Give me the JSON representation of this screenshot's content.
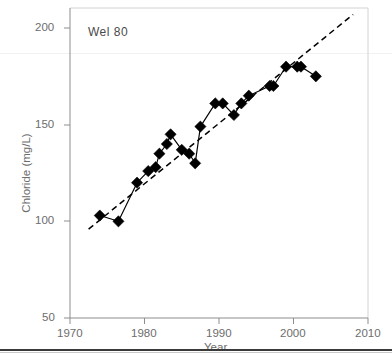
{
  "chart_data": {
    "type": "line",
    "title": "",
    "annotation": "Wel 80",
    "xlabel": "Year",
    "ylabel": "Chloride (mg/L)",
    "xlim": [
      1970,
      2010
    ],
    "ylim": [
      50,
      200
    ],
    "xticks": [
      1970,
      1980,
      1990,
      2000,
      2010
    ],
    "xtick_labels": [
      "1970",
      "1980",
      "1990",
      "2000",
      "2010"
    ],
    "yticks": [
      50,
      100,
      150,
      200
    ],
    "ytick_labels": [
      "50",
      "100",
      "150",
      "200"
    ],
    "grid": false,
    "legend": "none",
    "series": [
      {
        "name": "Chloride observations",
        "marker": "filled-diamond",
        "style": "solid-with-markers",
        "x": [
          1974,
          1976.5,
          1979,
          1980.5,
          1981.5,
          1982,
          1983,
          1983.5,
          1985,
          1986,
          1986.8,
          1987.5,
          1989.5,
          1990.5,
          1992,
          1993,
          1994,
          1996.8,
          1997.3,
          1999,
          2000.5,
          2001,
          2003
        ],
        "y": [
          103,
          100,
          120,
          126,
          128,
          135,
          140,
          145,
          137,
          135,
          130,
          149,
          161,
          161,
          155,
          161,
          165,
          170,
          170,
          180,
          180,
          180,
          175
        ],
        "points": [
          {
            "year": 1974,
            "value": 103
          },
          {
            "year": 1976.5,
            "value": 100
          },
          {
            "year": 1979,
            "value": 120
          },
          {
            "year": 1980.5,
            "value": 126
          },
          {
            "year": 1981.5,
            "value": 128
          },
          {
            "year": 1982,
            "value": 135
          },
          {
            "year": 1983,
            "value": 140
          },
          {
            "year": 1983.5,
            "value": 145
          },
          {
            "year": 1985,
            "value": 137
          },
          {
            "year": 1986,
            "value": 135
          },
          {
            "year": 1986.8,
            "value": 130
          },
          {
            "year": 1987.5,
            "value": 149
          },
          {
            "year": 1989.5,
            "value": 161
          },
          {
            "year": 1990.5,
            "value": 161
          },
          {
            "year": 1992,
            "value": 155
          },
          {
            "year": 1993,
            "value": 161
          },
          {
            "year": 1994,
            "value": 165
          },
          {
            "year": 1996.8,
            "value": 170
          },
          {
            "year": 1997.3,
            "value": 170
          },
          {
            "year": 1999,
            "value": 180
          },
          {
            "year": 2000.5,
            "value": 180
          },
          {
            "year": 2001,
            "value": 180
          },
          {
            "year": 2003,
            "value": 175
          }
        ]
      },
      {
        "name": "Linear trend",
        "style": "dashed",
        "x": [
          1972.5,
          2008
        ],
        "y": [
          96,
          207
        ]
      }
    ]
  }
}
